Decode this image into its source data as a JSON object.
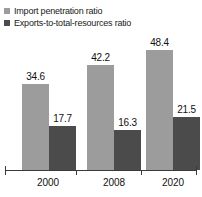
{
  "chart_data": {
    "type": "bar",
    "title": "",
    "subtitle": "",
    "xlabel": "",
    "ylabel": "",
    "categories": [
      "2000",
      "2008",
      "2020"
    ],
    "series": [
      {
        "name": "Import penetration ratio",
        "color": "#9c9c9c",
        "values": [
          34.6,
          42.2,
          48.4
        ],
        "labels": [
          "34.6",
          "42.2",
          "48.4"
        ]
      },
      {
        "name": "Exports-to-total-resources ratio",
        "color": "#4b4b4b",
        "values": [
          17.7,
          16.3,
          21.5
        ],
        "labels": [
          "17.7",
          "16.3",
          "21.5"
        ]
      }
    ],
    "ylim": [
      0,
      48.4
    ],
    "grid": false,
    "legend_position": "top-left",
    "value_labels_shown": true,
    "axis_color": "#3a3a3a"
  },
  "legend": {
    "items": [
      {
        "label": "Import penetration ratio",
        "marker": "square-light"
      },
      {
        "label": "Exports-to-total-resources ratio",
        "marker": "square-dark"
      }
    ]
  },
  "axis": {
    "x_tick_labels": [
      "2000",
      "2008",
      "2020"
    ]
  }
}
